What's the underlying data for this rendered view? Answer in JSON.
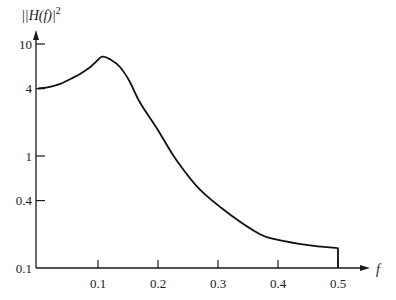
{
  "chart_data": {
    "type": "line",
    "title": "",
    "xlabel": "f",
    "ylabel": "|H(f)|",
    "ylabel_superscript": "2",
    "xscale": "linear",
    "yscale": "log",
    "xlim": [
      0,
      0.5
    ],
    "ylim": [
      0.1,
      10
    ],
    "grid": false,
    "legend": null,
    "x_ticks": [
      0.1,
      0.2,
      0.3,
      0.4,
      0.5
    ],
    "x_tick_labels": [
      "0.1",
      "0.2",
      "0.3",
      "0.4",
      "0.5"
    ],
    "y_ticks": [
      0.1,
      0.4,
      1,
      4,
      10
    ],
    "y_tick_labels": [
      "0.1",
      "0.4",
      "1",
      "4",
      "10"
    ],
    "series": [
      {
        "name": "|H(f)|^2",
        "color": "#111111",
        "x": [
          0.0,
          0.02,
          0.037,
          0.055,
          0.07,
          0.085,
          0.095,
          0.107,
          0.12,
          0.137,
          0.153,
          0.17,
          0.2,
          0.23,
          0.27,
          0.32,
          0.37,
          0.4,
          0.45,
          0.5
        ],
        "y": [
          4.0,
          4.15,
          4.4,
          4.9,
          5.4,
          6.1,
          6.8,
          7.7,
          7.3,
          6.2,
          4.6,
          3.0,
          1.7,
          0.93,
          0.5,
          0.3,
          0.2,
          0.178,
          0.16,
          0.15
        ]
      }
    ],
    "annotations": [
      "vertical drop to x-axis at f = 0.5"
    ]
  }
}
